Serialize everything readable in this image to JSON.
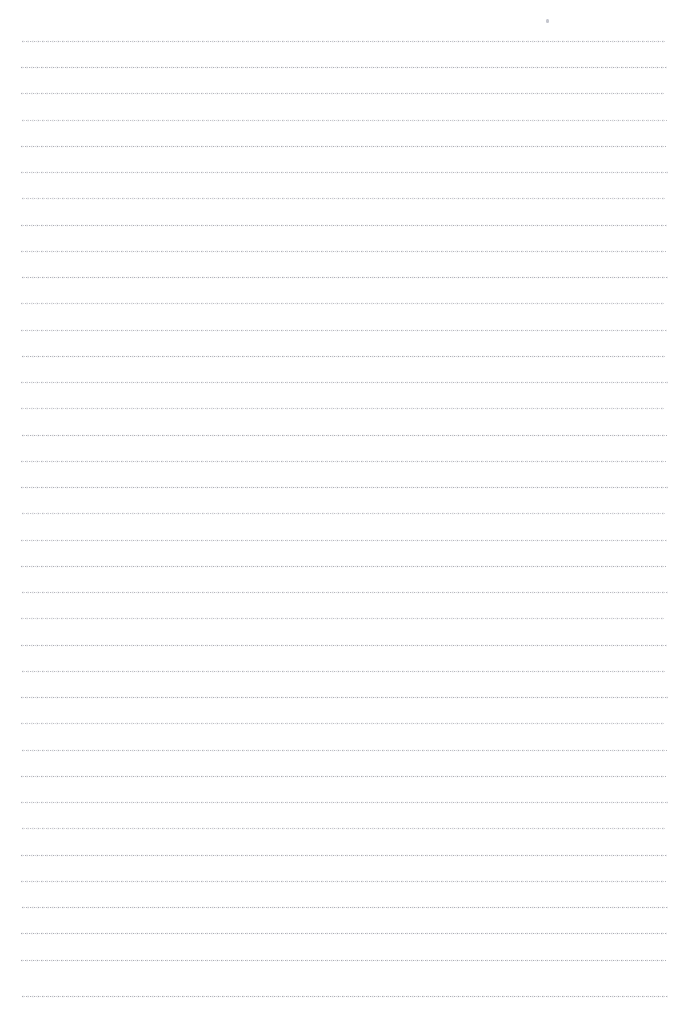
{
  "document": {
    "kind": "scanned-page",
    "description": "Blank ruled notebook page, scanned",
    "page_width": 683,
    "page_height": 1014,
    "background_color": "#ffffff",
    "has_text": false,
    "text_content": ""
  },
  "ruling": {
    "line_count": 37,
    "first_line_y": 41,
    "line_spacing": 26.3,
    "line_left": 21,
    "line_right": 668,
    "line_length": 647,
    "line_thickness": 1,
    "line_color": "#787a84",
    "line_style": "dotted",
    "orientation": "horizontal"
  },
  "margins": {
    "top": 41,
    "left": 21,
    "right": 15,
    "bottom": 17
  },
  "artifacts": [
    {
      "name": "scan-speck",
      "x": 546,
      "y": 19,
      "color": "#c4c6ce"
    }
  ],
  "lines": [
    {
      "index": 1,
      "y": 41,
      "tone": "tone-a",
      "x1": 22,
      "x2": 666
    },
    {
      "index": 2,
      "y": 67,
      "tone": "tone-b",
      "x1": 21,
      "x2": 667
    },
    {
      "index": 3,
      "y": 93,
      "tone": "tone-a",
      "x1": 21,
      "x2": 664
    },
    {
      "index": 4,
      "y": 120,
      "tone": "tone-c",
      "x1": 22,
      "x2": 667
    },
    {
      "index": 5,
      "y": 146,
      "tone": "tone-b",
      "x1": 21,
      "x2": 666
    },
    {
      "index": 6,
      "y": 172,
      "tone": "tone-a",
      "x1": 21,
      "x2": 668
    },
    {
      "index": 7,
      "y": 198,
      "tone": "tone-c",
      "x1": 22,
      "x2": 665
    },
    {
      "index": 8,
      "y": 225,
      "tone": "tone-b",
      "x1": 21,
      "x2": 667
    },
    {
      "index": 9,
      "y": 251,
      "tone": "tone-a",
      "x1": 21,
      "x2": 666
    },
    {
      "index": 10,
      "y": 277,
      "tone": "tone-b",
      "x1": 22,
      "x2": 668
    },
    {
      "index": 11,
      "y": 303,
      "tone": "tone-c",
      "x1": 21,
      "x2": 665
    },
    {
      "index": 12,
      "y": 330,
      "tone": "tone-a",
      "x1": 21,
      "x2": 667
    },
    {
      "index": 13,
      "y": 356,
      "tone": "tone-b",
      "x1": 22,
      "x2": 666
    },
    {
      "index": 14,
      "y": 382,
      "tone": "tone-a",
      "x1": 21,
      "x2": 668
    },
    {
      "index": 15,
      "y": 408,
      "tone": "tone-c",
      "x1": 21,
      "x2": 665
    },
    {
      "index": 16,
      "y": 435,
      "tone": "tone-b",
      "x1": 22,
      "x2": 667
    },
    {
      "index": 17,
      "y": 461,
      "tone": "tone-a",
      "x1": 21,
      "x2": 666
    },
    {
      "index": 18,
      "y": 487,
      "tone": "tone-b",
      "x1": 21,
      "x2": 668
    },
    {
      "index": 19,
      "y": 513,
      "tone": "tone-c",
      "x1": 22,
      "x2": 665
    },
    {
      "index": 20,
      "y": 540,
      "tone": "tone-a",
      "x1": 21,
      "x2": 667
    },
    {
      "index": 21,
      "y": 566,
      "tone": "tone-b",
      "x1": 21,
      "x2": 666
    },
    {
      "index": 22,
      "y": 592,
      "tone": "tone-a",
      "x1": 22,
      "x2": 668
    },
    {
      "index": 23,
      "y": 618,
      "tone": "tone-c",
      "x1": 21,
      "x2": 665
    },
    {
      "index": 24,
      "y": 645,
      "tone": "tone-b",
      "x1": 21,
      "x2": 667
    },
    {
      "index": 25,
      "y": 671,
      "tone": "tone-a",
      "x1": 22,
      "x2": 666
    },
    {
      "index": 26,
      "y": 697,
      "tone": "tone-b",
      "x1": 21,
      "x2": 668
    },
    {
      "index": 27,
      "y": 723,
      "tone": "tone-c",
      "x1": 21,
      "x2": 665
    },
    {
      "index": 28,
      "y": 750,
      "tone": "tone-a",
      "x1": 22,
      "x2": 667
    },
    {
      "index": 29,
      "y": 776,
      "tone": "tone-b",
      "x1": 21,
      "x2": 666
    },
    {
      "index": 30,
      "y": 802,
      "tone": "tone-a",
      "x1": 21,
      "x2": 668
    },
    {
      "index": 31,
      "y": 828,
      "tone": "tone-c",
      "x1": 22,
      "x2": 665
    },
    {
      "index": 32,
      "y": 855,
      "tone": "tone-b",
      "x1": 21,
      "x2": 667
    },
    {
      "index": 33,
      "y": 881,
      "tone": "tone-a",
      "x1": 21,
      "x2": 666
    },
    {
      "index": 34,
      "y": 907,
      "tone": "tone-b",
      "x1": 22,
      "x2": 668
    },
    {
      "index": 35,
      "y": 933,
      "tone": "tone-b",
      "x1": 21,
      "x2": 667
    },
    {
      "index": 36,
      "y": 960,
      "tone": "tone-b",
      "x1": 21,
      "x2": 666
    },
    {
      "index": 37,
      "y": 996,
      "tone": "tone-b",
      "x1": 22,
      "x2": 668
    }
  ]
}
